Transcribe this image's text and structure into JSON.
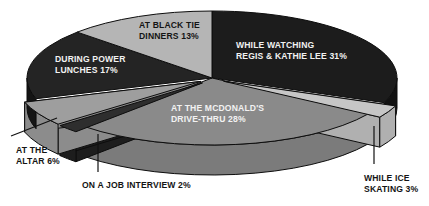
{
  "chart_data": {
    "type": "pie",
    "title": "",
    "subtitle": "",
    "xlabel": "",
    "ylabel": "",
    "legend_position": "none",
    "style": "3d-exploded-pie",
    "grid": false,
    "categories": [
      "WHILE WATCHING REGIS & KATHIE LEE",
      "AT THE MCDONALD'S DRIVE-THRU",
      "DURING POWER LUNCHES",
      "AT BLACK TIE DINNERS",
      "AT THE ALTAR",
      "WHILE ICE SKATING",
      "ON A JOB INTERVIEW"
    ],
    "values": [
      31,
      28,
      17,
      13,
      6,
      3,
      2
    ],
    "unit": "%",
    "slices": [
      {
        "name": "while-watching-regis-kathie-lee",
        "label": "WHILE WATCHING\nREGIS & KATHIE LEE 31%",
        "percent": 31,
        "percent_text": "31%",
        "color": "#1c1c1c",
        "side_color": "#111111",
        "text_color": "light",
        "exploded": false,
        "label_x": 236,
        "label_y": 40
      },
      {
        "name": "at-the-mcdonalds-drive-thru",
        "label": "AT THE MCDONALD'S\nDRIVE-THRU 28%",
        "percent": 28,
        "percent_text": "28%",
        "color": "#8a8a8a",
        "side_color": "#7b7b7b",
        "text_color": "light",
        "exploded": false,
        "label_x": 171,
        "label_y": 103
      },
      {
        "name": "during-power-lunches",
        "label": "DURING POWER\nLUNCHES 17%",
        "percent": 17,
        "percent_text": "17%",
        "color": "#242424",
        "side_color": "#151515",
        "text_color": "light",
        "exploded": false,
        "label_x": 55,
        "label_y": 54
      },
      {
        "name": "at-black-tie-dinners",
        "label": "AT BLACK TIE\nDINNERS 13%",
        "percent": 13,
        "percent_text": "13%",
        "color": "#b5b5b5",
        "side_color": "#a3a3a3",
        "text_color": "dark",
        "exploded": false,
        "label_x": 139,
        "label_y": 20
      },
      {
        "name": "at-the-altar",
        "label": "AT THE\nALTAR 6%",
        "percent": 6,
        "percent_text": "6%",
        "color": "#9e9e9e",
        "side_color": "#8c8c8c",
        "text_color": "dark",
        "exploded": true,
        "label_x": 16,
        "label_y": 145
      },
      {
        "name": "while-ice-skating",
        "label": "WHILE ICE\nSKATING 3%",
        "percent": 3,
        "percent_text": "3%",
        "color": "#c6c6c6",
        "side_color": "#b0b0b0",
        "text_color": "dark",
        "exploded": true,
        "label_x": 364,
        "label_y": 173
      },
      {
        "name": "on-a-job-interview",
        "label": "ON A JOB INTERVIEW 2%",
        "percent": 2,
        "percent_text": "2%",
        "color": "#2e2e2e",
        "side_color": "#1d1d1d",
        "text_color": "dark",
        "exploded": true,
        "label_x": 82,
        "label_y": 180
      }
    ],
    "callouts": [
      {
        "name": "at-the-altar",
        "line": {
          "x1": 11,
          "y1": 136,
          "x2": 57,
          "y2": 118
        }
      },
      {
        "name": "on-a-job-interview",
        "line": {
          "x1": 98,
          "y1": 172,
          "x2": 98,
          "y2": 134
        }
      },
      {
        "name": "while-ice-skating",
        "line": {
          "x1": 374,
          "y1": 164,
          "x2": 374,
          "y2": 126
        }
      }
    ]
  }
}
